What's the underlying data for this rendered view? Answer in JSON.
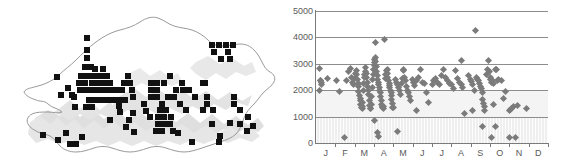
{
  "figure": {
    "title": "",
    "panels": [
      "distribution-map",
      "elevation-scatter"
    ]
  },
  "map": {
    "name": "Bhutan distribution map",
    "region_label": "",
    "outline_color": "#9a9a9a",
    "relief_color": "#d6d6d6",
    "marker_color": "#111111",
    "marker_shape": "square",
    "marker_count": 118,
    "markers": [
      [
        87,
        38
      ],
      [
        87,
        50
      ],
      [
        87,
        58
      ],
      [
        91,
        67
      ],
      [
        85,
        67
      ],
      [
        81,
        76
      ],
      [
        86,
        76
      ],
      [
        91,
        76
      ],
      [
        96,
        76
      ],
      [
        101,
        76
      ],
      [
        107,
        76
      ],
      [
        92,
        83
      ],
      [
        98,
        83
      ],
      [
        104,
        83
      ],
      [
        110,
        83
      ],
      [
        79,
        83
      ],
      [
        85,
        83
      ],
      [
        57,
        77
      ],
      [
        68,
        88
      ],
      [
        72,
        95
      ],
      [
        80,
        90
      ],
      [
        86,
        90
      ],
      [
        92,
        90
      ],
      [
        98,
        90
      ],
      [
        104,
        90
      ],
      [
        110,
        90
      ],
      [
        116,
        90
      ],
      [
        122,
        90
      ],
      [
        124,
        83
      ],
      [
        130,
        83
      ],
      [
        132,
        90
      ],
      [
        133,
        97
      ],
      [
        128,
        76
      ],
      [
        119,
        106
      ],
      [
        133,
        113
      ],
      [
        126,
        127
      ],
      [
        151,
        83
      ],
      [
        157,
        83
      ],
      [
        164,
        83
      ],
      [
        151,
        90
      ],
      [
        157,
        90
      ],
      [
        170,
        76
      ],
      [
        176,
        90
      ],
      [
        182,
        83
      ],
      [
        151,
        97
      ],
      [
        157,
        97
      ],
      [
        162,
        104
      ],
      [
        160,
        110
      ],
      [
        166,
        110
      ],
      [
        158,
        117
      ],
      [
        164,
        117
      ],
      [
        158,
        124
      ],
      [
        164,
        124
      ],
      [
        170,
        124
      ],
      [
        171,
        117
      ],
      [
        183,
        90
      ],
      [
        189,
        90
      ],
      [
        195,
        97
      ],
      [
        203,
        83
      ],
      [
        212,
        45
      ],
      [
        219,
        45
      ],
      [
        226,
        45
      ],
      [
        233,
        45
      ],
      [
        214,
        52
      ],
      [
        228,
        52
      ],
      [
        230,
        59
      ],
      [
        221,
        59
      ],
      [
        205,
        83
      ],
      [
        207,
        97
      ],
      [
        207,
        104
      ],
      [
        203,
        110
      ],
      [
        213,
        110
      ],
      [
        234,
        97
      ],
      [
        234,
        104
      ],
      [
        240,
        110
      ],
      [
        230,
        123
      ],
      [
        247,
        131
      ],
      [
        192,
        142
      ],
      [
        219,
        142
      ],
      [
        43,
        135
      ],
      [
        70,
        144
      ],
      [
        76,
        144
      ],
      [
        82,
        137
      ],
      [
        74,
        97
      ],
      [
        61,
        95
      ],
      [
        120,
        112
      ],
      [
        146,
        111
      ],
      [
        178,
        133
      ],
      [
        134,
        132
      ],
      [
        103,
        69
      ],
      [
        95,
        69
      ],
      [
        89,
        100
      ],
      [
        95,
        100
      ],
      [
        101,
        100
      ],
      [
        107,
        100
      ],
      [
        113,
        100
      ],
      [
        119,
        100
      ],
      [
        125,
        100
      ],
      [
        86,
        107
      ],
      [
        92,
        107
      ],
      [
        75,
        107
      ],
      [
        168,
        97
      ],
      [
        174,
        97
      ],
      [
        180,
        104
      ],
      [
        186,
        110
      ],
      [
        144,
        104
      ],
      [
        150,
        117
      ],
      [
        156,
        131
      ],
      [
        162,
        131
      ],
      [
        173,
        131
      ],
      [
        212,
        124
      ],
      [
        240,
        124
      ],
      [
        248,
        117
      ],
      [
        253,
        126
      ],
      [
        220,
        136
      ],
      [
        58,
        140
      ],
      [
        66,
        133
      ],
      [
        110,
        120
      ],
      [
        129,
        120
      ]
    ]
  },
  "chart_data": {
    "type": "scatter",
    "title": "",
    "xlabel": "",
    "ylabel": "",
    "xlim": [
      0,
      12
    ],
    "ylim": [
      0,
      5000
    ],
    "ytick_values": [
      0,
      1000,
      2000,
      3000,
      4000,
      5000
    ],
    "ytick_labels": [
      "0",
      "1000",
      "2000",
      "3000",
      "4000",
      "5000"
    ],
    "xtick_labels": [
      "J",
      "F",
      "M",
      "A",
      "M",
      "J",
      "J",
      "A",
      "S",
      "O",
      "N",
      "D"
    ],
    "xtick_full": [
      "January",
      "February",
      "March",
      "April",
      "May",
      "June",
      "July",
      "August",
      "September",
      "October",
      "November",
      "December"
    ],
    "grid": "horizontal",
    "legend": "none",
    "marker": "diamond",
    "marker_color": "#7b7b7b",
    "bands": [
      {
        "from": 0,
        "to": 1000,
        "shade": "#efefef",
        "texture": "vertical-hatch"
      },
      {
        "from": 1000,
        "to": 2000,
        "shade": "#f4f4f4",
        "texture": "none"
      }
    ],
    "points": [
      [
        0.2,
        2820
      ],
      [
        0.22,
        2380
      ],
      [
        0.25,
        2350
      ],
      [
        0.27,
        2280
      ],
      [
        0.3,
        2200
      ],
      [
        0.16,
        1970
      ],
      [
        0.6,
        2440
      ],
      [
        1.05,
        2380
      ],
      [
        1.2,
        1950
      ],
      [
        1.45,
        220
      ],
      [
        1.6,
        2350
      ],
      [
        1.7,
        2700
      ],
      [
        1.8,
        2820
      ],
      [
        1.85,
        2500
      ],
      [
        1.9,
        2300
      ],
      [
        1.95,
        2200
      ],
      [
        2.0,
        2450
      ],
      [
        2.05,
        2650
      ],
      [
        2.1,
        2740
      ],
      [
        2.12,
        2600
      ],
      [
        2.15,
        2400
      ],
      [
        2.18,
        2250
      ],
      [
        2.2,
        2150
      ],
      [
        2.22,
        1950
      ],
      [
        2.25,
        1800
      ],
      [
        2.28,
        1700
      ],
      [
        2.3,
        1620
      ],
      [
        2.32,
        1450
      ],
      [
        2.35,
        1350
      ],
      [
        2.38,
        1300
      ],
      [
        2.4,
        1380
      ],
      [
        2.42,
        1550
      ],
      [
        2.45,
        2000
      ],
      [
        2.48,
        2250
      ],
      [
        2.5,
        2480
      ],
      [
        2.52,
        2600
      ],
      [
        2.55,
        2720
      ],
      [
        2.58,
        2850
      ],
      [
        2.6,
        2640
      ],
      [
        2.62,
        2480
      ],
      [
        2.65,
        2300
      ],
      [
        2.68,
        2150
      ],
      [
        2.7,
        2000
      ],
      [
        2.72,
        1850
      ],
      [
        2.75,
        1600
      ],
      [
        2.78,
        1420
      ],
      [
        2.8,
        1320
      ],
      [
        2.82,
        1300
      ],
      [
        2.85,
        1450
      ],
      [
        2.88,
        1750
      ],
      [
        2.9,
        2100
      ],
      [
        2.92,
        2400
      ],
      [
        2.95,
        2600
      ],
      [
        2.98,
        2800
      ],
      [
        3.0,
        2950
      ],
      [
        3.02,
        3050
      ],
      [
        3.05,
        3150
      ],
      [
        3.08,
        3250
      ],
      [
        3.1,
        3100
      ],
      [
        3.12,
        2900
      ],
      [
        3.15,
        2700
      ],
      [
        3.18,
        2550
      ],
      [
        3.2,
        2400
      ],
      [
        3.22,
        2300
      ],
      [
        3.25,
        2200
      ],
      [
        3.28,
        2100
      ],
      [
        3.3,
        2000
      ],
      [
        3.32,
        1900
      ],
      [
        3.35,
        1750
      ],
      [
        3.38,
        1600
      ],
      [
        3.4,
        1450
      ],
      [
        3.42,
        1380
      ],
      [
        3.45,
        1330
      ],
      [
        3.48,
        1300
      ],
      [
        3.5,
        1400
      ],
      [
        3.1,
        3800
      ],
      [
        3.55,
        3930
      ],
      [
        3.05,
        850
      ],
      [
        3.18,
        380
      ],
      [
        3.22,
        260
      ],
      [
        3.6,
        2450
      ],
      [
        3.62,
        2600
      ],
      [
        3.65,
        2750
      ],
      [
        3.68,
        2800
      ],
      [
        3.7,
        2650
      ],
      [
        3.72,
        2480
      ],
      [
        3.75,
        2350
      ],
      [
        3.78,
        2250
      ],
      [
        3.8,
        2180
      ],
      [
        3.82,
        2100
      ],
      [
        3.85,
        2000
      ],
      [
        3.88,
        1900
      ],
      [
        3.9,
        1800
      ],
      [
        3.92,
        1650
      ],
      [
        3.95,
        1480
      ],
      [
        3.98,
        1360
      ],
      [
        4.0,
        1330
      ],
      [
        4.1,
        2400
      ],
      [
        4.15,
        2300
      ],
      [
        4.2,
        2200
      ],
      [
        4.25,
        2100
      ],
      [
        4.3,
        1980
      ],
      [
        4.35,
        1850
      ],
      [
        4.4,
        2250
      ],
      [
        4.45,
        2450
      ],
      [
        4.5,
        2800
      ],
      [
        4.55,
        2750
      ],
      [
        4.2,
        420
      ],
      [
        4.6,
        2500
      ],
      [
        4.65,
        2350
      ],
      [
        4.7,
        2150
      ],
      [
        4.75,
        2000
      ],
      [
        4.8,
        1900
      ],
      [
        4.85,
        1750
      ],
      [
        4.9,
        1620
      ],
      [
        5.0,
        2400
      ],
      [
        5.05,
        2280
      ],
      [
        5.1,
        2180
      ],
      [
        5.2,
        2350
      ],
      [
        5.3,
        2500
      ],
      [
        5.4,
        2800
      ],
      [
        5.5,
        2300
      ],
      [
        5.6,
        2250
      ],
      [
        5.7,
        1920
      ],
      [
        5.8,
        1550
      ],
      [
        5.2,
        1230
      ],
      [
        6.0,
        2200
      ],
      [
        6.1,
        2350
      ],
      [
        6.2,
        2450
      ],
      [
        6.3,
        2300
      ],
      [
        6.4,
        2200
      ],
      [
        6.5,
        2550
      ],
      [
        6.6,
        2780
      ],
      [
        6.7,
        2480
      ],
      [
        6.8,
        2380
      ],
      [
        6.9,
        2250
      ],
      [
        7.0,
        2200
      ],
      [
        7.1,
        2050
      ],
      [
        7.2,
        2750
      ],
      [
        7.3,
        2450
      ],
      [
        7.4,
        2280
      ],
      [
        7.5,
        3120
      ],
      [
        7.55,
        2200
      ],
      [
        7.6,
        2100
      ],
      [
        7.7,
        1100
      ],
      [
        7.9,
        2550
      ],
      [
        8.0,
        2420
      ],
      [
        8.05,
        2320
      ],
      [
        8.1,
        2230
      ],
      [
        8.2,
        1980
      ],
      [
        8.1,
        1220
      ],
      [
        8.25,
        4250
      ],
      [
        8.3,
        2500
      ],
      [
        8.35,
        2400
      ],
      [
        8.4,
        2350
      ],
      [
        8.45,
        2250
      ],
      [
        8.5,
        2150
      ],
      [
        8.55,
        2050
      ],
      [
        8.6,
        1900
      ],
      [
        8.62,
        1650
      ],
      [
        8.65,
        1500
      ],
      [
        8.7,
        1400
      ],
      [
        8.72,
        1250
      ],
      [
        8.6,
        630
      ],
      [
        8.8,
        2600
      ],
      [
        8.85,
        2800
      ],
      [
        8.9,
        3140
      ],
      [
        8.95,
        2700
      ],
      [
        9.0,
        2500
      ],
      [
        9.05,
        2400
      ],
      [
        9.1,
        2300
      ],
      [
        9.15,
        2350
      ],
      [
        9.2,
        2250
      ],
      [
        9.3,
        2780
      ],
      [
        9.35,
        2800
      ],
      [
        9.4,
        2350
      ],
      [
        9.45,
        2400
      ],
      [
        9.2,
        1450
      ],
      [
        9.3,
        630
      ],
      [
        9.1,
        215
      ],
      [
        9.6,
        2350
      ],
      [
        9.7,
        1680
      ],
      [
        9.8,
        1960
      ],
      [
        10.0,
        1250
      ],
      [
        10.05,
        1280
      ],
      [
        10.1,
        1300
      ],
      [
        10.2,
        1400
      ],
      [
        10.4,
        1420
      ],
      [
        10.0,
        220
      ],
      [
        10.3,
        215
      ],
      [
        10.9,
        1320
      ]
    ]
  }
}
